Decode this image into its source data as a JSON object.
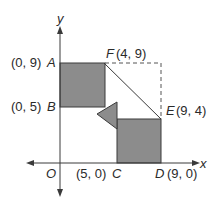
{
  "diagram": {
    "axes": {
      "x_label": "x",
      "y_label": "y",
      "origin_label": "O"
    },
    "points": {
      "A": {
        "name": "A",
        "coord": "(0, 9)"
      },
      "B": {
        "name": "B",
        "coord": "(0, 5)"
      },
      "F": {
        "name": "F",
        "coord": "(4, 9)"
      },
      "E": {
        "name": "E",
        "coord": "(9, 4)"
      },
      "C": {
        "name": "C",
        "coord": "(5, 0)"
      },
      "D": {
        "name": "D",
        "coord": "(9, 0)"
      }
    },
    "colors": {
      "fill": "#8c8c8c",
      "stroke": "#3a3a3a",
      "dashed": "#555555"
    }
  }
}
